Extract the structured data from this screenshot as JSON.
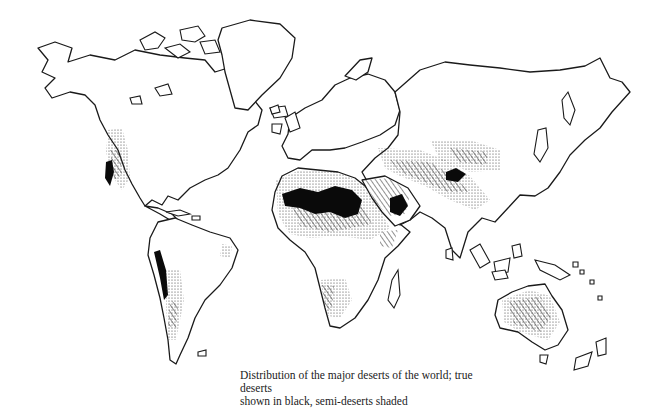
{
  "figure": {
    "type": "world-map-illustration",
    "caption_line1": "Distribution of the major deserts of the world; true deserts",
    "caption_line2": "shown in black, semi-deserts shaded"
  },
  "legend": {
    "true_desert": {
      "label": "true deserts",
      "style": "solid black",
      "color": "#0a0a0a"
    },
    "semi_desert": {
      "label": "semi-deserts",
      "style": "hatched / stippled shading",
      "color": "#444444"
    }
  },
  "map_features": {
    "true_deserts": [
      "Sahara",
      "Arabian",
      "Gobi/Takla Makan",
      "Atacama",
      "Sonoran/Mojave"
    ],
    "semi_deserts": [
      "Great Basin",
      "Patagonia",
      "Kalahari/Namib",
      "Australian interior",
      "Iran/Central Asia",
      "Thar",
      "Horn of Africa"
    ]
  },
  "colors": {
    "background": "#ffffff",
    "ink": "#1a1a1a"
  }
}
